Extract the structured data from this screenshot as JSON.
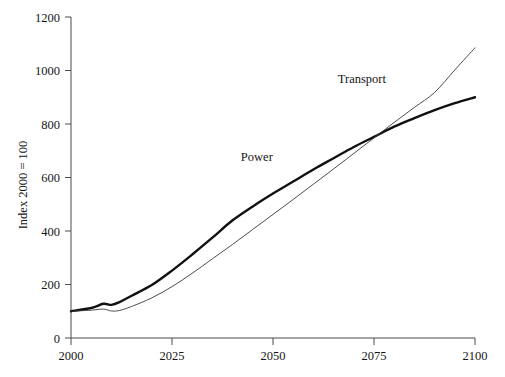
{
  "chart_data": {
    "type": "line",
    "title": "",
    "xlabel": "",
    "ylabel": "Index 2000 = 100",
    "xlim": [
      2000,
      2100
    ],
    "ylim": [
      0,
      1200
    ],
    "xticks": [
      2000,
      2025,
      2050,
      2075,
      2100
    ],
    "xtick_labels": [
      "2000",
      "2025",
      "2050",
      "2075",
      "2100"
    ],
    "yticks": [
      0,
      200,
      400,
      600,
      800,
      1000,
      1200
    ],
    "ytick_labels": [
      "0",
      "200",
      "400",
      "600",
      "800",
      "1000",
      "1200"
    ],
    "grid": false,
    "legend": "inline-annotations",
    "x": [
      2000,
      2005,
      2008,
      2010,
      2012,
      2015,
      2020,
      2025,
      2030,
      2035,
      2040,
      2045,
      2050,
      2055,
      2060,
      2065,
      2070,
      2075,
      2080,
      2085,
      2090,
      2095,
      2100
    ],
    "series": [
      {
        "name": "Power",
        "style": "thick",
        "color": "#111111",
        "width": 2.4,
        "label_text": "Power",
        "values": [
          100,
          112,
          128,
          124,
          134,
          158,
          198,
          252,
          312,
          375,
          440,
          492,
          540,
          585,
          630,
          672,
          714,
          752,
          790,
          822,
          852,
          878,
          900
        ]
      },
      {
        "name": "Transport",
        "style": "thin",
        "color": "#3a3a3a",
        "width": 0.9,
        "label_text": "Transport",
        "values": [
          100,
          104,
          108,
          101,
          103,
          118,
          150,
          192,
          242,
          296,
          350,
          406,
          462,
          518,
          575,
          632,
          690,
          748,
          806,
          862,
          918,
          1002,
          1085
        ]
      }
    ],
    "annotations": [
      {
        "text": "Transport",
        "x": 2072,
        "y": 952
      },
      {
        "text": "Power",
        "x": 2046,
        "y": 660
      }
    ]
  },
  "axis": {
    "y_title": "Index 2000 = 100"
  }
}
